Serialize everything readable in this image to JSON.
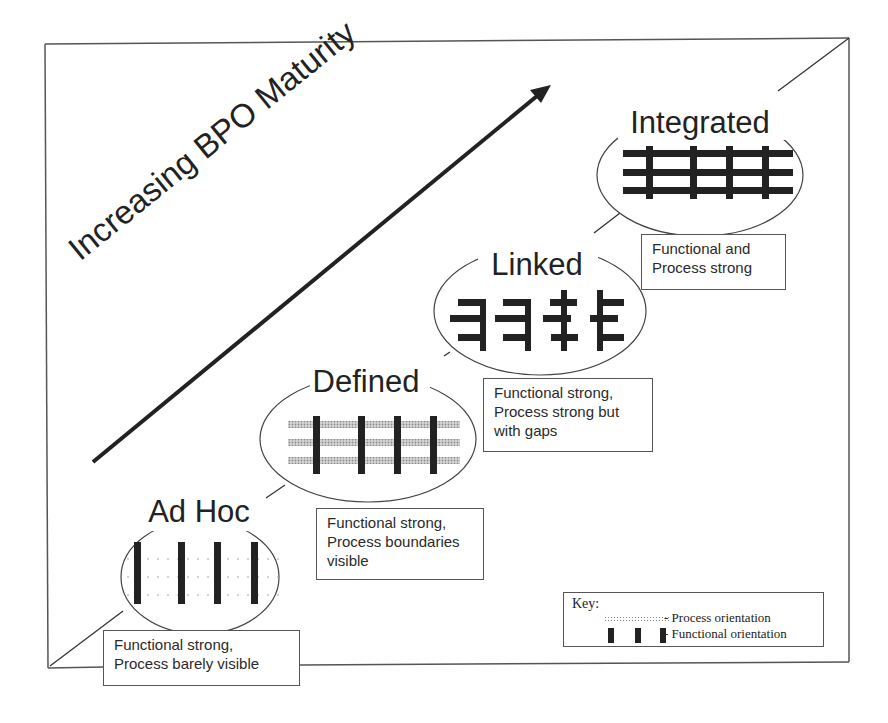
{
  "diagram": {
    "axis_label": "Increasing BPO Maturity",
    "stages": [
      {
        "name": "Ad Hoc",
        "description_lines": [
          "Functional strong,",
          "Process barely visible"
        ],
        "pattern": "functional-bars-with-faint-dotted-process"
      },
      {
        "name": "Defined",
        "description_lines": [
          "Functional strong,",
          "Process boundaries",
          "visible"
        ],
        "pattern": "functional-bars-with-shaded-process"
      },
      {
        "name": "Linked",
        "description_lines": [
          "Functional strong,",
          "Process strong but",
          "with gaps"
        ],
        "pattern": "functional-bars-with-partial-links"
      },
      {
        "name": "Integrated",
        "description_lines": [
          "Functional and",
          "Process strong"
        ],
        "pattern": "full-grid"
      }
    ],
    "key": {
      "title": "Key:",
      "items": [
        {
          "icon": "process-orientation-swatch",
          "label": "- Process orientation"
        },
        {
          "icon": "functional-orientation-swatch",
          "label": "- Functional orientation"
        }
      ]
    },
    "colors": {
      "ink": "#222222",
      "frame": "#555555",
      "process_shade": "#9a9a9a",
      "background": "#ffffff"
    }
  }
}
